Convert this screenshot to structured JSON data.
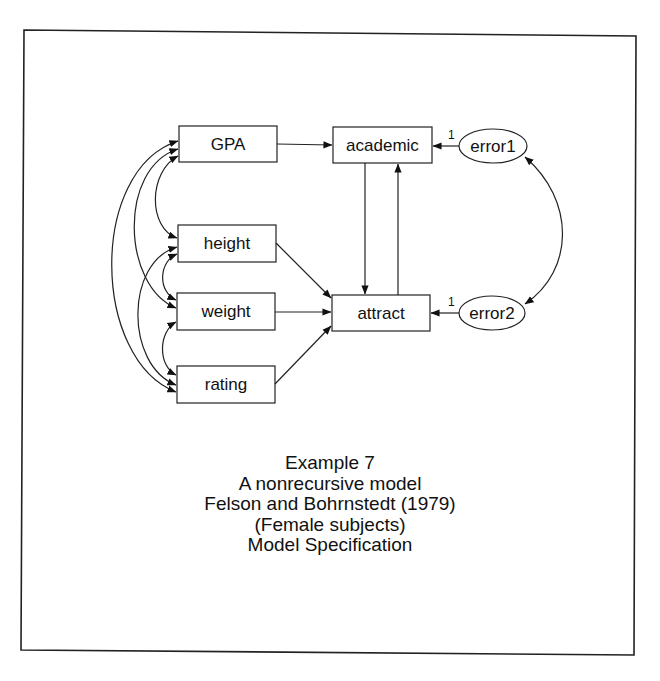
{
  "diagram": {
    "type": "path_diagram",
    "observed_variables": [
      {
        "id": "GPA",
        "label": "GPA"
      },
      {
        "id": "height",
        "label": "height"
      },
      {
        "id": "weight",
        "label": "weight"
      },
      {
        "id": "rating",
        "label": "rating"
      },
      {
        "id": "academic",
        "label": "academic"
      },
      {
        "id": "attract",
        "label": "attract"
      }
    ],
    "unobserved_variables": [
      {
        "id": "error1",
        "label": "error1"
      },
      {
        "id": "error2",
        "label": "error2"
      }
    ],
    "paths": [
      {
        "from": "GPA",
        "to": "academic"
      },
      {
        "from": "academic",
        "to": "attract"
      },
      {
        "from": "attract",
        "to": "academic"
      },
      {
        "from": "height",
        "to": "attract"
      },
      {
        "from": "weight",
        "to": "attract"
      },
      {
        "from": "rating",
        "to": "attract"
      },
      {
        "from": "error1",
        "to": "academic",
        "weight_label": "1"
      },
      {
        "from": "error2",
        "to": "attract",
        "weight_label": "1"
      }
    ],
    "covariances": [
      [
        "GPA",
        "height"
      ],
      [
        "GPA",
        "weight"
      ],
      [
        "GPA",
        "rating"
      ],
      [
        "height",
        "weight"
      ],
      [
        "height",
        "rating"
      ],
      [
        "weight",
        "rating"
      ],
      [
        "error1",
        "error2"
      ]
    ]
  },
  "nodes": {
    "gpa": "GPA",
    "height": "height",
    "weight": "weight",
    "rating": "rating",
    "academic": "academic",
    "attract": "attract",
    "error1": "error1",
    "error2": "error2"
  },
  "path_labels": {
    "error1_to_academic": "1",
    "error2_to_attract": "1"
  },
  "caption": {
    "line1": "Example 7",
    "line2": "A nonrecursive model",
    "line3": "Felson and Bohrnstedt (1979)",
    "line4": "(Female subjects)",
    "line5": "Model Specification"
  }
}
